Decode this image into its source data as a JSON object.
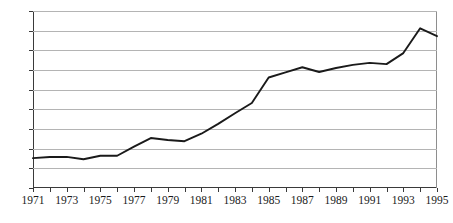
{
  "chart_data": {
    "type": "line",
    "title": "",
    "xlabel": "",
    "ylabel": "",
    "xlim": [
      1971,
      1995
    ],
    "ylim": [
      0,
      90
    ],
    "ytick_step": 10,
    "grid": true,
    "legend": "none",
    "line_color": "#1a1a1a",
    "gridline_color": "#b4b4b4",
    "axis_color": "#3a3a3a",
    "background": "#ffffff",
    "x": [
      1971,
      1972,
      1973,
      1974,
      1975,
      1976,
      1977,
      1978,
      1979,
      1980,
      1981,
      1982,
      1983,
      1984,
      1985,
      1986,
      1987,
      1988,
      1989,
      1990,
      1991,
      1992,
      1993,
      1994,
      1995
    ],
    "values": [
      15.2,
      15.8,
      15.8,
      14.6,
      16.4,
      16.4,
      21.0,
      25.4,
      24.4,
      23.8,
      27.6,
      32.6,
      38.0,
      43.2,
      56.2,
      58.8,
      61.4,
      59.0,
      61.0,
      62.6,
      63.6,
      63.0,
      68.6,
      81.2,
      77.2
    ],
    "ytick_labels": [
      "0",
      "10",
      "20",
      "30",
      "40",
      "50",
      "60",
      "70",
      "80",
      "90"
    ],
    "ytick_values": [
      0,
      10,
      20,
      30,
      40,
      50,
      60,
      70,
      80,
      90
    ],
    "xtick_values": [
      1971,
      1972,
      1973,
      1974,
      1975,
      1976,
      1977,
      1978,
      1979,
      1980,
      1981,
      1982,
      1983,
      1984,
      1985,
      1986,
      1987,
      1988,
      1989,
      1990,
      1991,
      1992,
      1993,
      1994,
      1995
    ],
    "xtick_labels": [
      "1971",
      "",
      "1973",
      "",
      "1975",
      "",
      "1977",
      "",
      "1979",
      "",
      "1981",
      "",
      "1983",
      "",
      "1985",
      "",
      "1987",
      "",
      "1989",
      "",
      "1991",
      "",
      "1993",
      "",
      "1995"
    ]
  }
}
